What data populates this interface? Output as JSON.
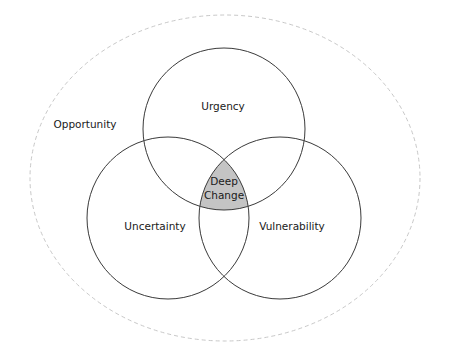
{
  "diagram": {
    "type": "venn",
    "outer_region": {
      "label": "Opportunity",
      "style": "dashed",
      "color": "#c8c8c8"
    },
    "sets": [
      {
        "id": "urgency",
        "label": "Urgency"
      },
      {
        "id": "uncertainty",
        "label": "Uncertainty"
      },
      {
        "id": "vulnerability",
        "label": "Vulnerability"
      }
    ],
    "intersection": {
      "label_line1": "Deep",
      "label_line2": "Change",
      "fill": "#c4c4c4"
    }
  }
}
